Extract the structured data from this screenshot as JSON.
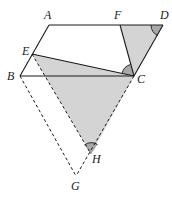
{
  "diagram": {
    "type": "geometry",
    "points": {
      "A": {
        "label": "A",
        "x": 49,
        "y": 25
      },
      "B": {
        "label": "B",
        "x": 20,
        "y": 76
      },
      "C": {
        "label": "C",
        "x": 134,
        "y": 76
      },
      "D": {
        "label": "D",
        "x": 163,
        "y": 25
      },
      "E": {
        "label": "E",
        "x": 32,
        "y": 54
      },
      "F": {
        "label": "F",
        "x": 120,
        "y": 25
      },
      "G": {
        "label": "G",
        "x": 76,
        "y": 176
      },
      "H": {
        "label": "H",
        "x": 91,
        "y": 154
      }
    },
    "shaded_regions": [
      "triangle FDC",
      "triangle ECH"
    ],
    "dashed_segments": [
      "BG",
      "GH",
      "EH"
    ],
    "angle_marks": [
      "angle D",
      "angle ECF",
      "angle H"
    ],
    "colors": {
      "line": "#1a1a1a",
      "shade": "#d4d4d4",
      "angle_shade": "#a8a8a8"
    }
  }
}
